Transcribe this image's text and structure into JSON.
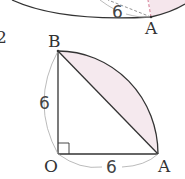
{
  "top_figure": {
    "point_label": "A",
    "length_label": "6"
  },
  "problem_number": "2",
  "main_figure": {
    "points": {
      "O": "O",
      "A": "A",
      "B": "B"
    },
    "side_OB": "6",
    "side_OA": "6",
    "right_angle_at": "O",
    "shaded_region": "segment between arc AB and chord AB",
    "colors": {
      "shade": "#f3e9ee",
      "line": "#333333",
      "guide": "#aaaaaa",
      "dash_pink": "#d98aa0"
    }
  }
}
